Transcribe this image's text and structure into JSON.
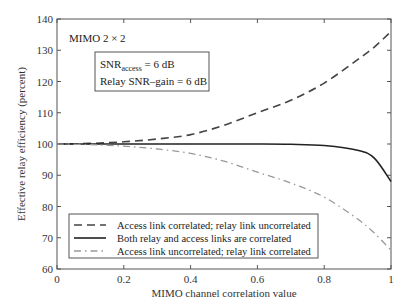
{
  "chart_data": {
    "type": "line",
    "title": "",
    "xlabel": "MIMO channel correlation value",
    "ylabel": "Effective relay efficiency (percent)",
    "xlim": [
      0,
      1
    ],
    "ylim": [
      60,
      140
    ],
    "xticks": [
      "0",
      "0.2",
      "0.4",
      "0.6",
      "0.8",
      "1"
    ],
    "yticks": [
      "60",
      "70",
      "80",
      "90",
      "100",
      "110",
      "120",
      "130",
      "140"
    ],
    "grid": false,
    "legend_position": "lower left",
    "annotations": {
      "config": "MIMO 2 × 2",
      "snr_access_prefix": "SNR",
      "snr_access_sub": "access",
      "snr_access_suffix": " = 6 dB",
      "relay_gain": "Relay SNR–gain = 6 dB"
    },
    "x": [
      0,
      0.1,
      0.2,
      0.3,
      0.4,
      0.5,
      0.6,
      0.7,
      0.8,
      0.9,
      0.95,
      1.0
    ],
    "series": [
      {
        "name": "Access link correlated; relay link uncorrelated",
        "style": "dashed",
        "values": [
          100,
          100.2,
          100.7,
          101.6,
          103,
          106,
          110,
          114,
          119.5,
          127,
          131,
          136
        ]
      },
      {
        "name": "Both relay and access links are correlated",
        "style": "solid",
        "values": [
          100,
          100,
          100,
          100,
          100,
          100,
          100,
          99.9,
          99.5,
          98,
          95.5,
          88
        ]
      },
      {
        "name": "Access link uncorrelated; relay link correlated",
        "style": "dash-dot",
        "values": [
          100,
          99.8,
          99.3,
          98.4,
          97,
          94.5,
          91,
          87.5,
          83,
          76,
          71.5,
          66
        ]
      }
    ]
  }
}
